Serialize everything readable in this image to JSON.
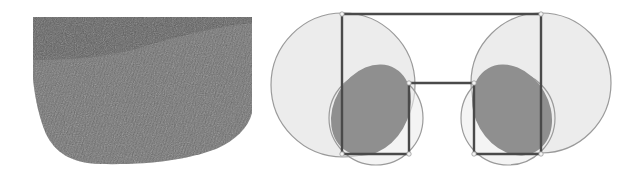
{
  "figure": {
    "width": 631,
    "height": 175,
    "background": "#ffffff"
  },
  "left_panel": {
    "name": "textured-band-render",
    "fill_dark": "#5c5c5c",
    "fill_band": "#777777",
    "outline_path": "M33,17 L252,17 L252,113 C248,128 236,140 216,149 C186,160 150,165 100,164 C70,163 55,152 46,134 C40,120 35,100 33,79 Z",
    "upper_region_path": "M33,17 L252,17 L252,23 C220,26 170,38 140,48 C115,55 80,60 33,60 Z",
    "stripe_count": 60
  },
  "diagram": {
    "stroke_line": "#4a4a4a",
    "stroke_circle": "#9a9a9a",
    "fill_light": "#ececec",
    "fill_dark": "#8f8f8f",
    "big_circles": [
      {
        "cx": 343,
        "cy": 85,
        "r": 72
      },
      {
        "cx": 541,
        "cy": 83,
        "r": 70
      }
    ],
    "small_circles": [
      {
        "cx": 376,
        "cy": 118,
        "r": 47
      },
      {
        "cx": 508,
        "cy": 118,
        "r": 47
      }
    ],
    "ellipses": [
      {
        "cx": 371,
        "cy": 110,
        "rx": 37,
        "ry": 48,
        "rotate": 30
      },
      {
        "cx": 512,
        "cy": 110,
        "rx": 37,
        "ry": 48,
        "rotate": -30
      }
    ],
    "polyline_points": "342,154 342,14 541,14 541,154 474,154 474,83 409,83 409,154 342,154",
    "vertices": [
      {
        "x": 342,
        "y": 14
      },
      {
        "x": 541,
        "y": 14
      },
      {
        "x": 409,
        "y": 83
      },
      {
        "x": 474,
        "y": 83
      },
      {
        "x": 342,
        "y": 154
      },
      {
        "x": 409,
        "y": 154
      },
      {
        "x": 474,
        "y": 154
      },
      {
        "x": 541,
        "y": 154
      }
    ]
  }
}
